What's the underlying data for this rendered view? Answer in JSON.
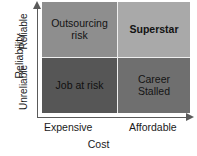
{
  "chart_data": {
    "type": "heatmap",
    "title": "",
    "subtitle": "",
    "xlabel": "Cost",
    "ylabel": "Reliability",
    "grid": false,
    "legend": "none",
    "x_categories": [
      "Expensive",
      "Affordable"
    ],
    "y_categories": [
      "Unreliable",
      "Reliable"
    ],
    "x_axis": {
      "title": "Cost",
      "ticks": [
        "Expensive",
        "Affordable"
      ],
      "arrow": "right",
      "direction_meaning": "Expensive to Affordable"
    },
    "y_axis": {
      "title": "Reliability",
      "ticks": [
        "Unreliable",
        "Reliable"
      ],
      "arrow": "up",
      "direction_meaning": "Unreliable to Reliable"
    },
    "cells": [
      {
        "id": "outsourcing-risk",
        "label": "Outsourcing\nrisk",
        "x": "Expensive",
        "y": "Reliable",
        "row": 0,
        "col": 0,
        "fill": "#8e8e8e",
        "text_color": "#131313",
        "bold": false
      },
      {
        "id": "superstar",
        "label": "Superstar",
        "x": "Affordable",
        "y": "Reliable",
        "row": 0,
        "col": 1,
        "fill": "#a9a9a9",
        "text_color": "#131313",
        "bold": true
      },
      {
        "id": "job-at-risk",
        "label": "Job at risk",
        "x": "Expensive",
        "y": "Unreliable",
        "row": 1,
        "col": 0,
        "fill": "#565656",
        "text_color": "#101010",
        "bold": false
      },
      {
        "id": "career-stalled",
        "label": "Career\nStalled",
        "x": "Affordable",
        "y": "Unreliable",
        "row": 1,
        "col": 1,
        "fill": "#6f6f6f",
        "text_color": "#141414",
        "bold": false
      }
    ],
    "divider_color": "#efefef",
    "axis_color": "#5a5a5a",
    "background": "#ffffff"
  },
  "axes": {
    "y_title": "Reliability",
    "y_tick_top": "Reliable",
    "y_tick_bottom": "Unreliable",
    "x_title": "Cost",
    "x_tick_left": "Expensive",
    "x_tick_right": "Affordable"
  },
  "quadrants": {
    "top_left": "Outsourcing\nrisk",
    "top_right": "Superstar",
    "bottom_left": "Job at risk",
    "bottom_right": "Career\nStalled"
  }
}
